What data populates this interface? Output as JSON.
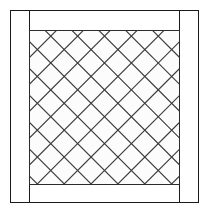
{
  "figure": {
    "caption": "",
    "canvas": {
      "width": 209,
      "height": 214,
      "background": "#ffffff"
    },
    "colors": {
      "line": "#1a1a1a",
      "lattice_line": "#3a3a3a",
      "panel_fill": "#fcfcfc",
      "background": "#ffffff"
    },
    "outer_frame": {
      "name": "outer-frame",
      "x": 10,
      "y": 10,
      "width": 189,
      "height": 193,
      "stroke_width": 1
    },
    "left_stile": {
      "name": "left-stile",
      "x": 10,
      "y": 10,
      "width": 19,
      "height": 193
    },
    "right_stile": {
      "name": "right-stile",
      "x": 180,
      "y": 10,
      "width": 19,
      "height": 193
    },
    "top_rail": {
      "name": "top-rail",
      "x": 29,
      "y": 10,
      "width": 151,
      "height": 20
    },
    "bottom_rail": {
      "name": "bottom-rail",
      "x": 29,
      "y": 185,
      "width": 151,
      "height": 18
    },
    "lattice_panel": {
      "name": "lattice-panel",
      "x": 29,
      "y": 30,
      "width": 151,
      "height": 155,
      "spacing": 19,
      "angle_degrees": 45,
      "diamond_columns": 8,
      "diamond_rows": 8,
      "stroke_width": 1.15
    }
  }
}
